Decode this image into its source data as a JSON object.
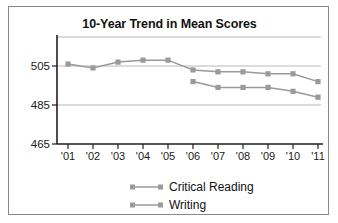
{
  "chart_data": {
    "type": "line",
    "title": "10-Year Trend in Mean Scores",
    "xlabel": "",
    "ylabel": "",
    "categories": [
      "'01",
      "'02",
      "'03",
      "'04",
      "'05",
      "'06",
      "'07",
      "'08",
      "'09",
      "'10",
      "'11"
    ],
    "ylim": [
      465,
      515
    ],
    "yticks": [
      465,
      485,
      505
    ],
    "ytick_labels": [
      "465",
      "485",
      "505"
    ],
    "grid": true,
    "legend_position": "bottom",
    "series": [
      {
        "name": "Critical Reading",
        "values": [
          506,
          504,
          507,
          508,
          508,
          503,
          502,
          502,
          501,
          501,
          497
        ]
      },
      {
        "name": "Writing",
        "values": [
          null,
          null,
          null,
          null,
          null,
          497,
          494,
          494,
          494,
          492,
          489
        ]
      }
    ]
  },
  "chart": {
    "title": "10-Year Trend in Mean Scores",
    "y_tick_labels": [
      "505",
      "485",
      "465"
    ],
    "x_tick_labels": [
      "'01",
      "'02",
      "'03",
      "'04",
      "'05",
      "'06",
      "'07",
      "'08",
      "'09",
      "'10",
      "'11"
    ],
    "legend": [
      {
        "label": "Critical Reading"
      },
      {
        "label": "Writing"
      }
    ],
    "colors": {
      "series": "#9a9a9a",
      "grid": "#b9b9b9",
      "axis": "#1f1f1f",
      "text": "#111111",
      "frame": "#8a8a8a",
      "background": "#ffffff"
    }
  }
}
